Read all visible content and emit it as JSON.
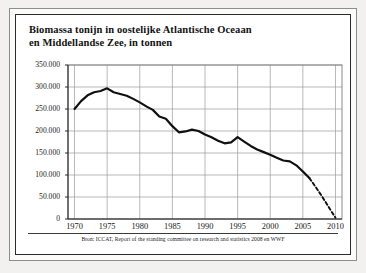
{
  "figure": {
    "title_line_1": "Biomassa tonijn in oostelijke Atlantische Oceaan",
    "title_line_2": "en Middellandse Zee, in tonnen",
    "source": "Bron: ICCAT, Report of the standing committee on research and statistics 2008 en WWF"
  },
  "chart_data": {
    "type": "line",
    "title": "Biomassa tonijn in oostelijke Atlantische Oceaan en Middellandse Zee, in tonnen",
    "xlabel": "",
    "ylabel": "",
    "xlim": [
      1969,
      2011
    ],
    "ylim": [
      0,
      350000
    ],
    "ytick_labels": [
      "350.000",
      "300.000",
      "250.000",
      "200.000",
      "150.000",
      "100.000",
      "50.000",
      "0"
    ],
    "ytick_values": [
      350000,
      300000,
      250000,
      200000,
      150000,
      100000,
      50000,
      0
    ],
    "xtick_labels": [
      "1970",
      "1975",
      "1980",
      "1985",
      "1990",
      "1995",
      "2000",
      "2005",
      "2010"
    ],
    "xtick_values": [
      1970,
      1975,
      1980,
      1985,
      1990,
      1995,
      2000,
      2005,
      2010
    ],
    "grid": true,
    "legend": false,
    "series": [
      {
        "name": "Biomassa (waargenomen)",
        "style": "solid",
        "color": "#101010",
        "x": [
          1970,
          1971,
          1972,
          1973,
          1974,
          1975,
          1976,
          1977,
          1978,
          1979,
          1980,
          1981,
          1982,
          1983,
          1984,
          1985,
          1986,
          1987,
          1988,
          1989,
          1990,
          1991,
          1992,
          1993,
          1994,
          1995,
          1996,
          1997,
          1998,
          1999,
          2000,
          2001,
          2002,
          2003,
          2004,
          2005,
          2006
        ],
        "values": [
          250000,
          268000,
          281000,
          288000,
          291000,
          297000,
          288000,
          284000,
          280000,
          273000,
          265000,
          256000,
          248000,
          233000,
          228000,
          211000,
          197000,
          199000,
          203000,
          200000,
          192000,
          186000,
          178000,
          172000,
          174000,
          186000,
          176000,
          166000,
          158000,
          152000,
          146000,
          139000,
          133000,
          131000,
          122000,
          108000,
          93000
        ]
      },
      {
        "name": "Biomassa (prognose)",
        "style": "dashed",
        "color": "#101010",
        "x": [
          2006,
          2007,
          2008,
          2009,
          2010
        ],
        "values": [
          93000,
          72000,
          50000,
          26000,
          3000
        ]
      }
    ]
  }
}
